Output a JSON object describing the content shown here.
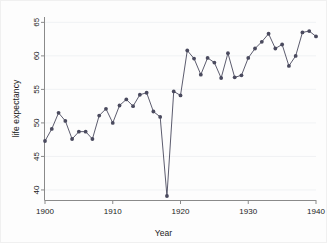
{
  "chart_data": {
    "type": "line",
    "title": "",
    "xlabel": "Year",
    "ylabel": "life expectancy",
    "xlim": [
      1900,
      1940
    ],
    "ylim": [
      38.5,
      65.8
    ],
    "xticks": [
      1900,
      1910,
      1920,
      1930,
      1940
    ],
    "yticks": [
      40,
      45,
      50,
      55,
      60,
      65
    ],
    "grid": "horizontal",
    "legend": "none",
    "marker": "filled-circle",
    "series_color": "#4a4a5e",
    "x": [
      1900,
      1901,
      1902,
      1903,
      1904,
      1905,
      1906,
      1907,
      1908,
      1909,
      1910,
      1911,
      1912,
      1913,
      1914,
      1915,
      1916,
      1917,
      1918,
      1919,
      1920,
      1921,
      1922,
      1923,
      1924,
      1925,
      1926,
      1927,
      1928,
      1929,
      1930,
      1931,
      1932,
      1933,
      1934,
      1935,
      1936,
      1937,
      1938,
      1939,
      1940
    ],
    "y": [
      47.3,
      49.1,
      51.5,
      50.3,
      47.6,
      48.7,
      48.7,
      47.6,
      51.1,
      52.1,
      50.0,
      52.6,
      53.5,
      52.5,
      54.2,
      54.5,
      51.7,
      50.9,
      39.1,
      54.7,
      54.1,
      60.8,
      59.6,
      57.2,
      59.7,
      59.0,
      56.7,
      60.4,
      56.8,
      57.1,
      59.7,
      61.1,
      62.1,
      63.3,
      61.1,
      61.7,
      58.5,
      60.0,
      63.5,
      63.7,
      62.9
    ]
  }
}
